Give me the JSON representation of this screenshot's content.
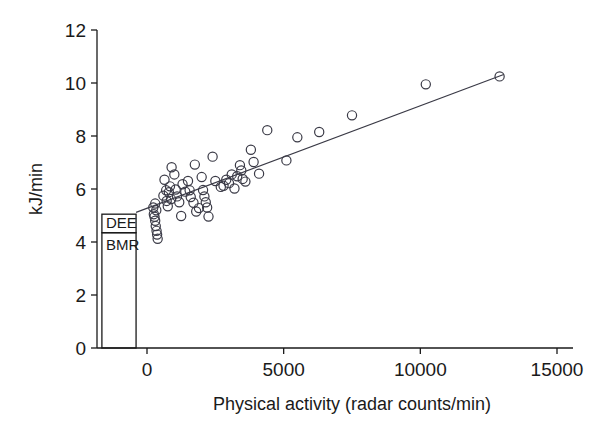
{
  "chart_data": {
    "type": "scatter",
    "title": "",
    "subtitle": "",
    "xlabel": "Physical activity (radar counts/min)",
    "ylabel": "kJ/min",
    "xlim": [
      -1700,
      15600
    ],
    "ylim": [
      0,
      12
    ],
    "xticks": [
      0,
      5000,
      10000,
      15000
    ],
    "xticklabels": [
      "0",
      "5000",
      "10000",
      "15000"
    ],
    "yticks": [
      0,
      2,
      4,
      6,
      8,
      10,
      12
    ],
    "yticklabels": [
      "0",
      "2",
      "4",
      "6",
      "8",
      "10",
      "12"
    ],
    "grid": false,
    "legend": null,
    "marker": "open-circle",
    "series": [
      {
        "name": "Subjects",
        "points": [
          [
            230,
            5.3
          ],
          [
            250,
            5.05
          ],
          [
            275,
            4.95
          ],
          [
            300,
            4.8
          ],
          [
            320,
            4.6
          ],
          [
            350,
            4.42
          ],
          [
            370,
            4.28
          ],
          [
            390,
            4.12
          ],
          [
            340,
            5.2
          ],
          [
            300,
            5.45
          ],
          [
            600,
            5.75
          ],
          [
            640,
            6.35
          ],
          [
            700,
            5.95
          ],
          [
            720,
            5.55
          ],
          [
            760,
            5.35
          ],
          [
            800,
            5.88
          ],
          [
            840,
            6.1
          ],
          [
            880,
            5.62
          ],
          [
            900,
            6.82
          ],
          [
            1000,
            6.55
          ],
          [
            1050,
            5.98
          ],
          [
            1100,
            5.72
          ],
          [
            1180,
            5.5
          ],
          [
            1250,
            4.98
          ],
          [
            1300,
            6.18
          ],
          [
            1400,
            5.9
          ],
          [
            1500,
            6.3
          ],
          [
            1560,
            5.95
          ],
          [
            1600,
            5.7
          ],
          [
            1700,
            5.48
          ],
          [
            1750,
            6.92
          ],
          [
            1800,
            5.15
          ],
          [
            1900,
            5.28
          ],
          [
            2000,
            6.45
          ],
          [
            2050,
            5.96
          ],
          [
            2100,
            5.72
          ],
          [
            2150,
            5.5
          ],
          [
            2200,
            5.3
          ],
          [
            2250,
            4.96
          ],
          [
            2400,
            7.22
          ],
          [
            2500,
            6.3
          ],
          [
            2700,
            6.08
          ],
          [
            2800,
            6.12
          ],
          [
            2900,
            6.35
          ],
          [
            3000,
            6.22
          ],
          [
            3100,
            6.55
          ],
          [
            3200,
            6.02
          ],
          [
            3300,
            6.48
          ],
          [
            3400,
            6.9
          ],
          [
            3450,
            6.7
          ],
          [
            3500,
            6.38
          ],
          [
            3600,
            6.28
          ],
          [
            3800,
            7.48
          ],
          [
            3900,
            7.02
          ],
          [
            4100,
            6.58
          ],
          [
            4400,
            8.22
          ],
          [
            5100,
            7.08
          ],
          [
            5500,
            7.95
          ],
          [
            6300,
            8.15
          ],
          [
            7500,
            8.78
          ],
          [
            10200,
            9.95
          ],
          [
            12900,
            10.25
          ]
        ]
      }
    ],
    "fit_line": {
      "name": "regression line",
      "x_start": -400,
      "y_start": 5.12,
      "x_end": 13050,
      "y_end": 10.32
    },
    "annotations": [
      {
        "name": "dee-bmr-bar",
        "x_left": -1650,
        "x_right": -400,
        "segments": [
          {
            "label": "DEE",
            "y_low": 4.35,
            "y_high": 5.05
          },
          {
            "label": "BMR",
            "y_low": 0.0,
            "y_high": 4.35
          }
        ]
      }
    ],
    "colors": {
      "axis": "#1a1a1a",
      "marker_stroke": "#3a3a46",
      "marker_fill": "none",
      "fit_line": "#3a3a46",
      "text": "#1a1a1a",
      "background": "#ffffff"
    }
  }
}
